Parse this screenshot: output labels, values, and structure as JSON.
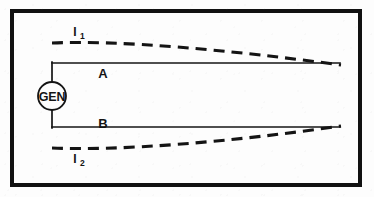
{
  "figure": {
    "border": {
      "color": "#111111",
      "stroke_width": 4,
      "x": 12,
      "y": 11,
      "width": 348,
      "height": 174
    },
    "background_color": "#fdfdfd",
    "line_color": "#141414"
  },
  "source": {
    "label": "GEN",
    "name": "generator",
    "center_x": 52,
    "center_y": 96,
    "radius": 14
  },
  "conductors": [
    {
      "id": "A",
      "label": "A",
      "label_x": 103,
      "label_y": 78,
      "y": 63,
      "x_start": 52,
      "x_end": 340,
      "style": "solid"
    },
    {
      "id": "B",
      "label": "B",
      "label_x": 103,
      "label_y": 128,
      "y": 127,
      "x_start": 52,
      "x_end": 340,
      "style": "solid"
    }
  ],
  "currents": [
    {
      "id": "I1",
      "label": "I",
      "subscript": "1",
      "label_x": 75,
      "label_y": 36,
      "style": "dashed",
      "path": "M 52 43 C 120 40, 230 50, 341 65",
      "description": "upper dashed return path converging to conductor A"
    },
    {
      "id": "I2",
      "label": "I",
      "subscript": "2",
      "label_x": 75,
      "label_y": 163,
      "style": "dashed",
      "path": "M 52 148 C 120 151, 230 142, 341 126",
      "description": "lower dashed return path converging to conductor B"
    }
  ],
  "leads": [
    {
      "name": "upper-lead",
      "x": 52,
      "y1": 63,
      "y2": 82
    },
    {
      "name": "lower-lead",
      "x": 52,
      "y1": 110,
      "y2": 127
    }
  ]
}
